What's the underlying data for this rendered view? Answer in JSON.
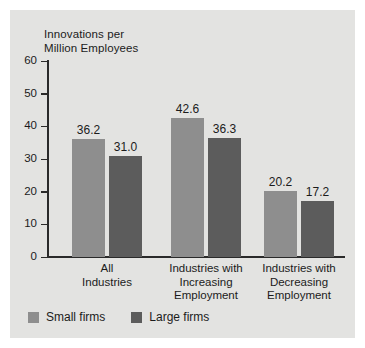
{
  "chart_data": {
    "type": "bar",
    "title": "",
    "ylabel": "Innovations per\nMillion Employees",
    "xlabel": "",
    "ylim": [
      0,
      60
    ],
    "yticks": [
      0,
      10,
      20,
      30,
      40,
      50,
      60
    ],
    "ytick_labels": [
      "0",
      "10",
      "20",
      "30",
      "40",
      "50",
      "60"
    ],
    "grid": false,
    "legend_position": "bottom-left",
    "categories": [
      "All\nIndustries",
      "Industries with\nIncreasing\nEmployment",
      "Industries with\nDecreasing\nEmployment"
    ],
    "series": [
      {
        "name": "Small firms",
        "color": "#8e8e8e",
        "values": [
          36.2,
          42.6,
          20.2
        ],
        "value_labels": [
          "36.2",
          "42.6",
          "20.2"
        ]
      },
      {
        "name": "Large firms",
        "color": "#5c5c5c",
        "values": [
          31.0,
          36.3,
          17.2
        ],
        "value_labels": [
          "31.0",
          "36.3",
          "17.2"
        ]
      }
    ]
  },
  "panel": {
    "background_color": "#e3e3e1",
    "axis_color": "#2a2a2a"
  }
}
